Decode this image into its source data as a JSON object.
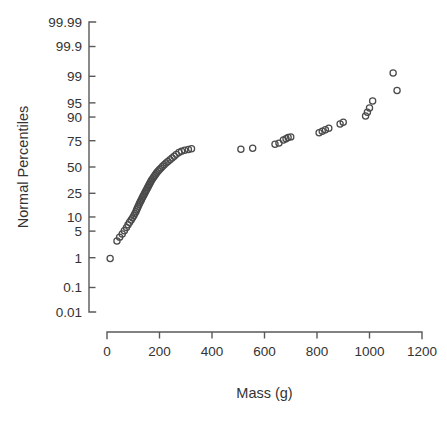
{
  "chart": {
    "type_label": "normal-probability-plot",
    "background": "#ffffff",
    "marker_color": "#4a4a4a",
    "axis_color": "#595959",
    "text_color": "#333333"
  },
  "chart_data": {
    "type": "scatter",
    "title": "",
    "subtitle": "",
    "xlabel": "Mass (g)",
    "ylabel": "Normal Percentiles",
    "xlim": [
      0,
      1200
    ],
    "ylim_percentile": [
      0.01,
      99.99
    ],
    "grid": false,
    "legend": null,
    "x_ticks": [
      0,
      200,
      400,
      600,
      800,
      1000,
      1200
    ],
    "x_tick_labels": [
      "0",
      "200",
      "400",
      "600",
      "800",
      "1000",
      "1200"
    ],
    "y_ticks": [
      0.01,
      0.1,
      1,
      5,
      10,
      25,
      50,
      75,
      90,
      95,
      99,
      99.9,
      99.99
    ],
    "y_tick_labels": [
      "0.01",
      "0.1",
      "1",
      "5",
      "10",
      "25",
      "50",
      "75",
      "90",
      "95",
      "99",
      "99.9",
      "99.99"
    ],
    "y_scale": "normal-probability",
    "series": [
      {
        "name": "Mass sample",
        "marker": "open-circle",
        "x": [
          12,
          38,
          48,
          58,
          66,
          74,
          80,
          86,
          92,
          97,
          102,
          106,
          110,
          113,
          116,
          119,
          122,
          125,
          128,
          131,
          134,
          137,
          140,
          143,
          146,
          149,
          152,
          155,
          158,
          161,
          164,
          167,
          170,
          174,
          178,
          182,
          186,
          190,
          195,
          200,
          206,
          212,
          218,
          225,
          232,
          240,
          248,
          256,
          264,
          274,
          284,
          296,
          310,
          322,
          510,
          555,
          640,
          655,
          672,
          682,
          690,
          700,
          808,
          820,
          832,
          845,
          888,
          900,
          985,
          992,
          1000,
          1012,
          1090,
          1105
        ],
        "y_percentile": [
          0.95,
          2.9,
          3.6,
          4.3,
          5.1,
          6.0,
          6.9,
          7.8,
          8.7,
          9.6,
          10.6,
          11.6,
          12.6,
          13.6,
          14.6,
          15.7,
          16.8,
          17.9,
          19.0,
          20.1,
          21.3,
          22.5,
          23.7,
          24.9,
          26.1,
          27.4,
          28.7,
          30.0,
          31.3,
          32.7,
          34.1,
          35.5,
          36.9,
          38.3,
          39.8,
          41.3,
          42.8,
          44.3,
          45.9,
          47.5,
          49.1,
          50.7,
          52.4,
          54.0,
          55.7,
          57.4,
          59.2,
          60.9,
          62.7,
          64.5,
          65.8,
          66.6,
          67.4,
          68.0,
          67.5,
          68.5,
          72.0,
          73.0,
          75.5,
          76.5,
          77.5,
          78.0,
          81.0,
          82.0,
          83.0,
          84.0,
          86.5,
          87.5,
          90.5,
          92.0,
          93.5,
          95.5,
          99.2,
          97.5
        ],
        "point_count": 74
      }
    ]
  }
}
